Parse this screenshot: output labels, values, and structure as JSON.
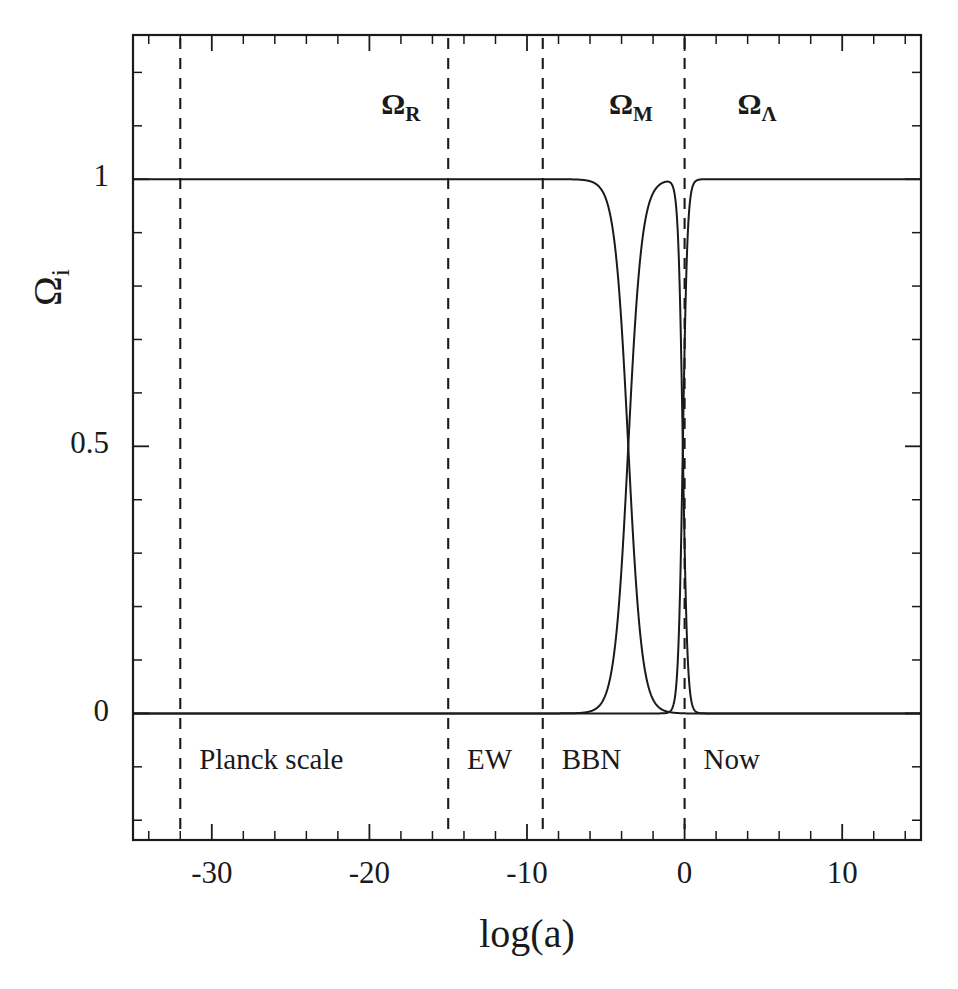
{
  "figure": {
    "background_color": "#ffffff",
    "ink_color": "#1a1a1a"
  },
  "chart_data": {
    "type": "line",
    "title": "",
    "subtitle": "",
    "xlabel": "log(a)",
    "ylabel": "Ω",
    "ylabel_sub": "i",
    "xlim": [
      -35,
      15
    ],
    "ylim": [
      -0.237,
      1.27
    ],
    "grid": false,
    "legend_position": "none",
    "x_ticks_major": [
      -30,
      -20,
      -10,
      0,
      10
    ],
    "x_tick_labels": [
      "-30",
      "-20",
      "-10",
      "0",
      "10"
    ],
    "x_tick_minor_step": 2,
    "y_ticks_major": [
      0,
      0.5,
      1
    ],
    "y_tick_labels": [
      "0",
      "0.5",
      "1"
    ],
    "y_tick_minor_step": 0.1,
    "model": {
      "omega_r0": 8.4e-05,
      "omega_m0": 0.315,
      "omega_l0": 0.685
    },
    "series": [
      {
        "name": "Ω_R",
        "label": "Ω",
        "sublabel": "R",
        "description": "Radiation density parameter",
        "color": "#1a1a1a",
        "dash": "solid"
      },
      {
        "name": "Ω_M",
        "label": "Ω",
        "sublabel": "M",
        "description": "Matter density parameter",
        "color": "#1a1a1a",
        "dash": "solid"
      },
      {
        "name": "Ω_Λ",
        "label": "Ω",
        "sublabel": "Λ",
        "description": "Dark energy density parameter",
        "color": "#1a1a1a",
        "dash": "solid"
      }
    ],
    "region_labels": [
      {
        "text": "Ω",
        "sub": "R",
        "x": -18.0,
        "y": 1.135
      },
      {
        "text": "Ω",
        "sub": "M",
        "x": -3.4,
        "y": 1.135
      },
      {
        "text": "Ω",
        "sub": "Λ",
        "x": 4.6,
        "y": 1.135
      }
    ],
    "epoch_markers": [
      {
        "label": "Planck scale",
        "x": -32.0,
        "label_x": -30.8,
        "label_y": -0.092
      },
      {
        "label": "EW",
        "x": -15.0,
        "label_x": -13.8,
        "label_y": -0.092
      },
      {
        "label": "BBN",
        "x": -9.0,
        "label_x": -7.8,
        "label_y": -0.092
      },
      {
        "label": "Now",
        "x": 0.0,
        "label_x": 1.2,
        "label_y": -0.092
      }
    ]
  }
}
